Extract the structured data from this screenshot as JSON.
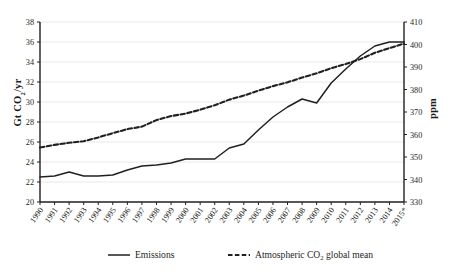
{
  "chart_data": {
    "type": "line",
    "title": "",
    "xlabel": "",
    "ylabel": "Gt CO2/yr",
    "ylabel_parts": {
      "pre": "Gt CO",
      "sub": "2",
      "post": "/yr"
    },
    "y2label": "ppm",
    "ylim": [
      20,
      38
    ],
    "y2lim": [
      330,
      410
    ],
    "yticks": [
      20,
      22,
      24,
      26,
      28,
      30,
      32,
      34,
      36,
      38
    ],
    "y2ticks": [
      330,
      340,
      350,
      360,
      370,
      380,
      390,
      400,
      410
    ],
    "grid": true,
    "grid_color": "#e8e8e8",
    "legend_position": "bottom",
    "categories": [
      "1990",
      "1991",
      "1992",
      "1993",
      "1994",
      "1995",
      "1996",
      "1997",
      "1998",
      "1999",
      "2000",
      "2001",
      "2002",
      "2003",
      "2004",
      "2005",
      "2006",
      "2007",
      "2008",
      "2009",
      "2010",
      "2011",
      "2012",
      "2013",
      "2014",
      "2015*"
    ],
    "series": [
      {
        "name": "Emissions",
        "axis": "left",
        "unit": "Gt CO2/yr",
        "style": "solid",
        "color": "#231f20",
        "values": [
          22.5,
          22.6,
          23.0,
          22.6,
          22.6,
          22.7,
          23.2,
          23.6,
          23.7,
          23.9,
          24.3,
          24.3,
          24.3,
          25.4,
          25.8,
          27.2,
          28.5,
          29.5,
          30.3,
          29.9,
          31.9,
          33.3,
          34.6,
          35.6,
          36.0,
          36.0
        ]
      },
      {
        "name": "Atmospheric CO2 global mean",
        "axis": "right",
        "unit": "ppm",
        "style": "dashed",
        "color": "#231f20",
        "values": [
          354.2,
          355.4,
          356.3,
          357.0,
          358.7,
          360.6,
          362.4,
          363.5,
          366.4,
          368.2,
          369.3,
          371.0,
          373.0,
          375.5,
          377.3,
          379.5,
          381.5,
          383.2,
          385.3,
          387.2,
          389.5,
          391.3,
          393.5,
          396.3,
          398.4,
          400.4
        ]
      }
    ],
    "annotations": []
  },
  "legend": {
    "items": [
      {
        "label": "Emissions",
        "style": "solid"
      },
      {
        "label_pre": "Atmospheric CO",
        "label_sub": "2",
        "label_post": " global mean",
        "style": "dashed"
      }
    ]
  }
}
